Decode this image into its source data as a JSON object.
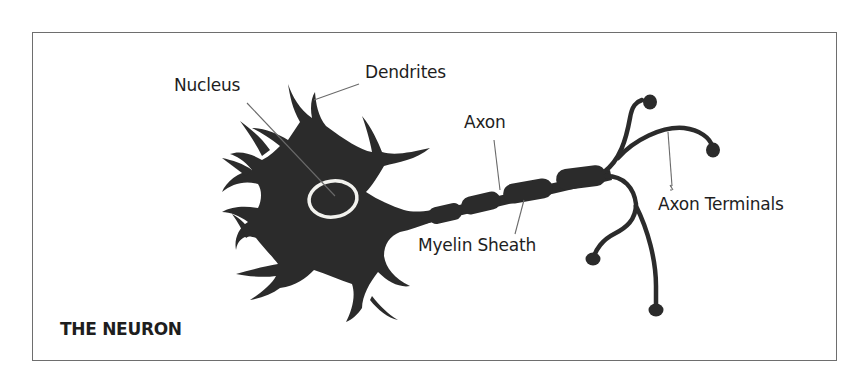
{
  "diagram": {
    "title": "THE NEURON",
    "labels": {
      "nucleus": "Nucleus",
      "dendrites": "Dendrites",
      "axon": "Axon",
      "myelin_sheath": "Myelin Sheath",
      "axon_terminals": "Axon Terminals"
    },
    "colors": {
      "neuron_fill": "#2b2b2b",
      "nucleus_outline": "#f2f2ee",
      "leader_line": "#6a6a6a",
      "frame_border": "#6e6e6e",
      "text": "#1e1e1e"
    }
  }
}
